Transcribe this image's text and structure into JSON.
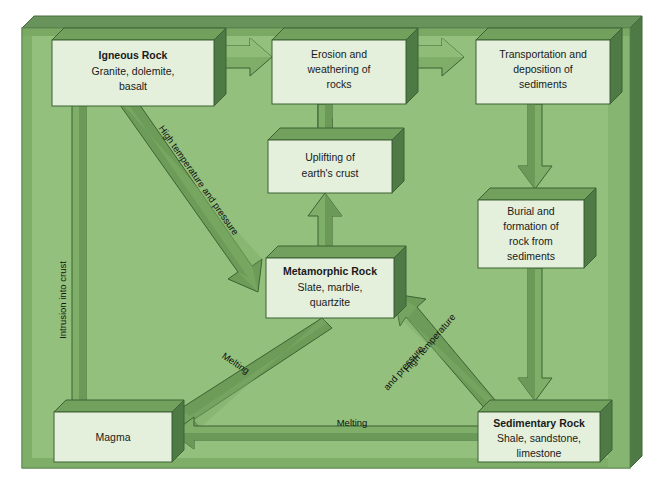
{
  "diagram": {
    "frame": {
      "face_color": "#8dba76",
      "bevel_top_color": "#5f8a52",
      "bevel_side_color": "#4f7a45",
      "outline_color": "#3f6638"
    },
    "palette": {
      "box_face": "#e4efdc",
      "box_top": "#77a362",
      "box_side": "#4e7b45",
      "box_outline": "#3d6234",
      "arrow_face": "#7fae68",
      "arrow_shade": "#4f7c43",
      "arrow_outline": "#3c6233",
      "text": "#1a1a1a"
    },
    "boxes": [
      {
        "id": "igneous-rock",
        "name": "box-igneous-rock",
        "title": "Igneous Rock",
        "lines": [
          "Granite, dolemite,",
          "basalt"
        ]
      },
      {
        "id": "erosion-weathering",
        "name": "box-erosion-weathering",
        "title": "",
        "lines": [
          "Erosion and",
          "weathering of",
          "rocks"
        ]
      },
      {
        "id": "transportation-deposition",
        "name": "box-transportation-deposition",
        "title": "",
        "lines": [
          "Transportation and",
          "deposition of",
          "sediments"
        ]
      },
      {
        "id": "burial-formation",
        "name": "box-burial-formation",
        "title": "",
        "lines": [
          "Burial and",
          "formation of",
          "rock from",
          "sediments"
        ]
      },
      {
        "id": "sedimentary-rock",
        "name": "box-sedimentary-rock",
        "title": "Sedimentary Rock",
        "lines": [
          "Shale, sandstone,",
          "limestone"
        ]
      },
      {
        "id": "uplifting",
        "name": "box-uplifting",
        "title": "",
        "lines": [
          "Uplifting of",
          "earth's crust"
        ]
      },
      {
        "id": "metamorphic-rock",
        "name": "box-metamorphic-rock",
        "title": "Metamorphic Rock",
        "lines": [
          "Slate, marble,",
          "quartzite"
        ]
      },
      {
        "id": "magma",
        "name": "box-magma",
        "title": "",
        "lines": [
          "Magma"
        ]
      }
    ],
    "arrow_labels": {
      "intrusion": "Intrusion into crust",
      "high_temp_pressure_igneous": "High temperature and pressure",
      "high_temp_pressure_sed_1": "High temperature",
      "high_temp_pressure_sed_2": "and pressure",
      "melting_metamorphic": "Melting",
      "melting_sedimentary": "Melting"
    },
    "arrows": [
      {
        "name": "arrow-igneous-to-erosion",
        "from": "igneous-rock",
        "to": "erosion-weathering",
        "label": ""
      },
      {
        "name": "arrow-erosion-to-transportation",
        "from": "erosion-weathering",
        "to": "transportation-deposition",
        "label": ""
      },
      {
        "name": "arrow-transportation-to-burial",
        "from": "transportation-deposition",
        "to": "burial-formation",
        "label": ""
      },
      {
        "name": "arrow-burial-to-sedimentary",
        "from": "burial-formation",
        "to": "sedimentary-rock",
        "label": ""
      },
      {
        "name": "arrow-sedimentary-to-metamorphic",
        "from": "sedimentary-rock",
        "to": "metamorphic-rock",
        "label": "High temperature and pressure"
      },
      {
        "name": "arrow-metamorphic-to-uplifting",
        "from": "metamorphic-rock",
        "to": "uplifting",
        "label": ""
      },
      {
        "name": "arrow-uplifting-to-erosion",
        "from": "uplifting",
        "to": "erosion-weathering",
        "label": ""
      },
      {
        "name": "arrow-igneous-to-metamorphic",
        "from": "igneous-rock",
        "to": "metamorphic-rock",
        "label": "High temperature and pressure"
      },
      {
        "name": "arrow-metamorphic-to-magma",
        "from": "metamorphic-rock",
        "to": "magma",
        "label": "Melting"
      },
      {
        "name": "arrow-sedimentary-to-magma",
        "from": "sedimentary-rock",
        "to": "magma",
        "label": "Melting"
      },
      {
        "name": "arrow-magma-to-igneous",
        "from": "magma",
        "to": "igneous-rock",
        "label": "Intrusion into crust"
      }
    ]
  }
}
